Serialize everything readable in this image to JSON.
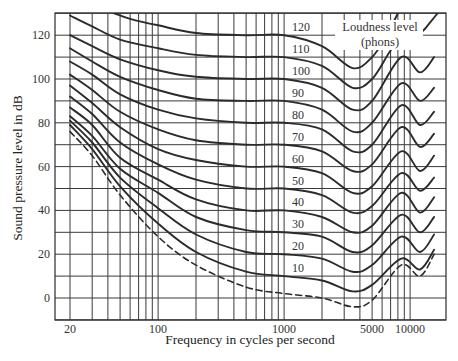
{
  "chart_data": {
    "type": "line",
    "title": "",
    "xlabel": "Frequency in cycles per second",
    "ylabel": "Sound pressure level in dB",
    "xscale": "log",
    "xlim": [
      15,
      19300
    ],
    "ylim": [
      -10,
      130
    ],
    "grid": true,
    "x_ticks": [
      {
        "value": 20,
        "label": "20"
      },
      {
        "value": 100,
        "label": "100"
      },
      {
        "value": 1000,
        "label": "1000"
      },
      {
        "value": 5000,
        "label": "5000"
      },
      {
        "value": 10000,
        "label": "10000"
      }
    ],
    "y_ticks": [
      {
        "value": 0,
        "label": "0"
      },
      {
        "value": 20,
        "label": "20"
      },
      {
        "value": 40,
        "label": "40"
      },
      {
        "value": 60,
        "label": "60"
      },
      {
        "value": 80,
        "label": "80"
      },
      {
        "value": 100,
        "label": "100"
      },
      {
        "value": 120,
        "label": "120"
      }
    ],
    "x_gridlines": [
      20,
      30,
      40,
      50,
      60,
      70,
      80,
      90,
      100,
      200,
      300,
      400,
      500,
      600,
      700,
      800,
      900,
      1000,
      2000,
      3000,
      4000,
      5000,
      6000,
      7000,
      8000,
      9000,
      10000
    ],
    "y_gridlines": [
      -10,
      0,
      10,
      20,
      30,
      40,
      50,
      60,
      70,
      80,
      90,
      100,
      110,
      120,
      130
    ],
    "legend_title": [
      "Loudness level",
      "(phons)"
    ],
    "series": [
      {
        "name": "120",
        "label_db": 120,
        "style": "solid",
        "points": [
          [
            45,
            130
          ],
          [
            60,
            127.5
          ],
          [
            100,
            124.5
          ],
          [
            200,
            121
          ],
          [
            500,
            120
          ],
          [
            1000,
            120
          ],
          [
            2000,
            115
          ],
          [
            3500,
            105
          ],
          [
            5000,
            110
          ],
          [
            6500,
            120
          ],
          [
            8000,
            130
          ]
        ]
      },
      {
        "name": "110",
        "label_db": 110,
        "style": "solid",
        "points": [
          [
            20,
            129
          ],
          [
            30,
            124
          ],
          [
            50,
            118
          ],
          [
            100,
            114
          ],
          [
            200,
            111
          ],
          [
            500,
            110
          ],
          [
            1000,
            110
          ],
          [
            2000,
            106
          ],
          [
            3500,
            96
          ],
          [
            5000,
            100
          ],
          [
            7000,
            113
          ],
          [
            9000,
            120
          ],
          [
            12000,
            121
          ],
          [
            14500,
            126
          ],
          [
            16500,
            130
          ]
        ]
      },
      {
        "name": "100",
        "label_db": 100,
        "style": "solid",
        "points": [
          [
            20,
            120
          ],
          [
            30,
            115
          ],
          [
            50,
            109
          ],
          [
            100,
            104
          ],
          [
            200,
            101
          ],
          [
            500,
            100
          ],
          [
            1000,
            100
          ],
          [
            2000,
            96
          ],
          [
            3500,
            86
          ],
          [
            5000,
            90
          ],
          [
            8500,
            110
          ],
          [
            12000,
            103
          ],
          [
            15500,
            110
          ]
        ]
      },
      {
        "name": "90",
        "label_db": 90,
        "style": "solid",
        "points": [
          [
            20,
            114
          ],
          [
            30,
            108
          ],
          [
            50,
            101
          ],
          [
            100,
            95
          ],
          [
            200,
            91
          ],
          [
            500,
            90
          ],
          [
            1000,
            90
          ],
          [
            2000,
            86
          ],
          [
            3500,
            76
          ],
          [
            5000,
            80
          ],
          [
            8500,
            98
          ],
          [
            12000,
            90
          ],
          [
            15500,
            96
          ]
        ]
      },
      {
        "name": "80",
        "label_db": 80,
        "style": "solid",
        "points": [
          [
            20,
            108
          ],
          [
            30,
            102
          ],
          [
            50,
            93
          ],
          [
            100,
            86
          ],
          [
            200,
            82
          ],
          [
            500,
            80
          ],
          [
            1000,
            80
          ],
          [
            2000,
            77
          ],
          [
            3500,
            67
          ],
          [
            5000,
            70
          ],
          [
            8500,
            88
          ],
          [
            12000,
            79
          ],
          [
            15500,
            85
          ]
        ]
      },
      {
        "name": "70",
        "label_db": 70,
        "style": "solid",
        "points": [
          [
            20,
            102
          ],
          [
            30,
            95
          ],
          [
            50,
            85
          ],
          [
            100,
            77
          ],
          [
            200,
            72
          ],
          [
            500,
            70
          ],
          [
            1000,
            70
          ],
          [
            2000,
            67
          ],
          [
            3500,
            58
          ],
          [
            5000,
            61
          ],
          [
            8500,
            78
          ],
          [
            12000,
            69
          ],
          [
            15500,
            75
          ]
        ]
      },
      {
        "name": "60",
        "label_db": 60,
        "style": "solid",
        "points": [
          [
            20,
            97
          ],
          [
            30,
            89
          ],
          [
            50,
            78
          ],
          [
            100,
            68
          ],
          [
            200,
            63
          ],
          [
            500,
            60
          ],
          [
            1000,
            60
          ],
          [
            2000,
            57
          ],
          [
            3500,
            48
          ],
          [
            5000,
            51
          ],
          [
            8500,
            67
          ],
          [
            12000,
            58
          ],
          [
            15500,
            65
          ]
        ]
      },
      {
        "name": "50",
        "label_db": 50,
        "style": "solid",
        "points": [
          [
            20,
            92
          ],
          [
            30,
            84
          ],
          [
            50,
            71
          ],
          [
            100,
            61
          ],
          [
            200,
            54
          ],
          [
            500,
            50
          ],
          [
            1000,
            50
          ],
          [
            2000,
            47
          ],
          [
            3500,
            39
          ],
          [
            5000,
            42
          ],
          [
            8500,
            57
          ],
          [
            12000,
            49
          ],
          [
            15500,
            55
          ]
        ]
      },
      {
        "name": "40",
        "label_db": 40,
        "style": "solid",
        "points": [
          [
            20,
            87
          ],
          [
            30,
            79
          ],
          [
            50,
            64
          ],
          [
            100,
            54
          ],
          [
            200,
            45
          ],
          [
            500,
            40
          ],
          [
            1000,
            40
          ],
          [
            2000,
            37
          ],
          [
            3500,
            30
          ],
          [
            5000,
            33
          ],
          [
            8500,
            48
          ],
          [
            12000,
            39
          ],
          [
            15500,
            46
          ]
        ]
      },
      {
        "name": "30",
        "label_db": 30,
        "style": "solid",
        "points": [
          [
            20,
            83
          ],
          [
            30,
            74
          ],
          [
            50,
            59
          ],
          [
            100,
            48
          ],
          [
            200,
            37
          ],
          [
            500,
            31
          ],
          [
            1000,
            30
          ],
          [
            2000,
            28
          ],
          [
            3500,
            21
          ],
          [
            5000,
            24
          ],
          [
            8500,
            38
          ],
          [
            12000,
            30
          ],
          [
            15500,
            37
          ]
        ]
      },
      {
        "name": "20",
        "label_db": 20,
        "style": "solid",
        "points": [
          [
            20,
            81
          ],
          [
            30,
            71
          ],
          [
            50,
            55
          ],
          [
            100,
            41
          ],
          [
            200,
            29
          ],
          [
            500,
            21
          ],
          [
            1000,
            20
          ],
          [
            2000,
            18
          ],
          [
            3500,
            12
          ],
          [
            5000,
            15
          ],
          [
            8500,
            28
          ],
          [
            12000,
            21
          ],
          [
            15500,
            29
          ]
        ]
      },
      {
        "name": "10",
        "label_db": 10,
        "style": "solid",
        "points": [
          [
            20,
            79
          ],
          [
            30,
            68
          ],
          [
            50,
            51
          ],
          [
            100,
            34
          ],
          [
            200,
            21
          ],
          [
            500,
            12
          ],
          [
            1000,
            10
          ],
          [
            2000,
            8
          ],
          [
            3500,
            3
          ],
          [
            5000,
            6
          ],
          [
            8500,
            18
          ],
          [
            12000,
            13
          ],
          [
            15500,
            22
          ]
        ]
      },
      {
        "name": "threshold",
        "label_db": null,
        "style": "dashed",
        "points": [
          [
            20,
            76
          ],
          [
            30,
            65
          ],
          [
            50,
            47
          ],
          [
            100,
            28
          ],
          [
            200,
            15
          ],
          [
            500,
            5
          ],
          [
            1000,
            2
          ],
          [
            2000,
            0
          ],
          [
            3500,
            -4
          ],
          [
            5000,
            -1
          ],
          [
            8500,
            15
          ],
          [
            12000,
            10
          ],
          [
            15500,
            20
          ]
        ]
      }
    ]
  }
}
